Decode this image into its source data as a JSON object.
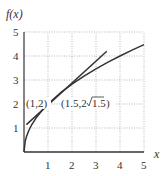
{
  "chart_data": {
    "type": "line",
    "title": "",
    "xlabel": "x",
    "ylabel": "f(x)",
    "xlim": [
      0,
      5
    ],
    "ylim": [
      0,
      5
    ],
    "grid": true,
    "x_ticks": [
      "1",
      "2",
      "3",
      "4",
      "5"
    ],
    "y_ticks": [
      "1",
      "2",
      "3",
      "4",
      "5"
    ],
    "series": [
      {
        "name": "f(x) = 2√x",
        "x": [
          0,
          0.05,
          0.1,
          0.2,
          0.3,
          0.5,
          0.75,
          1,
          1.5,
          2,
          2.5,
          3,
          3.5,
          4,
          4.5,
          5
        ],
        "values": [
          0,
          0.447,
          0.632,
          0.894,
          1.095,
          1.414,
          1.732,
          2,
          2.449,
          2.828,
          3.162,
          3.464,
          3.742,
          4,
          4.243,
          4.472
        ]
      },
      {
        "name": "line through (1,2) and (1.5, 2√1.5)",
        "x": [
          0.1,
          3.45
        ],
        "values": [
          1.14,
          4.2
        ]
      }
    ],
    "annotations": [
      {
        "text": "(1,2)",
        "x": 1,
        "y": 2
      },
      {
        "text": "(1.5,2√1.5)",
        "x": 1.5,
        "y": 2.449
      }
    ]
  },
  "labels": {
    "ylabel": "f(x)",
    "xlabel": "x",
    "point1": "(1,2)",
    "point2_prefix": "(1.5,2",
    "point2_radicand": "1.5",
    "point2_suffix": ")",
    "xticks": [
      "1",
      "2",
      "3",
      "4",
      "5"
    ],
    "yticks": [
      "1",
      "2",
      "3",
      "4",
      "5"
    ]
  },
  "colors": {
    "curve": "#333333",
    "grid": "#999999",
    "axis": "#333333"
  }
}
